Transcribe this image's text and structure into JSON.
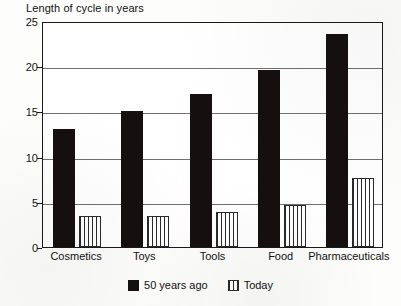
{
  "chart_data": {
    "type": "bar",
    "title": "Length of cycle in years",
    "xlabel": "",
    "ylabel": "",
    "ylim": [
      0,
      25
    ],
    "yticks": [
      0,
      5,
      10,
      15,
      20,
      25
    ],
    "grid": true,
    "legend_position": "bottom-center",
    "categories": [
      "Cosmetics",
      "Toys",
      "Tools",
      "Food",
      "Pharmaceuticals"
    ],
    "series": [
      {
        "name": "50 years ago",
        "color": "#15100f",
        "fill": "solid",
        "values": [
          13.0,
          15.0,
          16.9,
          19.6,
          23.6
        ]
      },
      {
        "name": "Today",
        "color": "#2a2a2a",
        "fill": "vertical-hatch",
        "values": [
          3.4,
          3.4,
          3.9,
          4.7,
          7.6
        ]
      }
    ]
  },
  "legend": {
    "items": [
      {
        "label": "50 years ago",
        "swatch": "solid-black-square-icon"
      },
      {
        "label": "Today",
        "swatch": "hatched-square-icon"
      }
    ]
  },
  "axis": {
    "y_tick_labels": [
      "25",
      "20",
      "15",
      "10",
      "5",
      "0"
    ]
  }
}
